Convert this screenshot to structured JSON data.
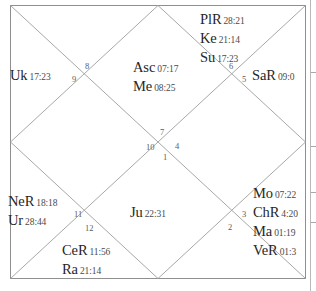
{
  "chart": {
    "type": "north-indian-vedic-kundli",
    "border_color": "#8a8a8a",
    "line_color": "#a0a0a0",
    "text_color": "#262626"
  },
  "houses": [
    {
      "number": "1",
      "x": 163,
      "y": 152
    },
    {
      "number": "2",
      "x": 228,
      "y": 222
    },
    {
      "number": "3",
      "x": 242,
      "y": 209
    },
    {
      "number": "4",
      "x": 175,
      "y": 141
    },
    {
      "number": "5",
      "x": 242,
      "y": 74
    },
    {
      "number": "6",
      "x": 229,
      "y": 61
    },
    {
      "number": "7",
      "x": 160,
      "y": 127
    },
    {
      "number": "8",
      "x": 85,
      "y": 61
    },
    {
      "number": "9",
      "x": 72,
      "y": 74
    },
    {
      "number": "10",
      "x": 146,
      "y": 142
    },
    {
      "number": "11",
      "x": 74,
      "y": 209
    },
    {
      "number": "12",
      "x": 85,
      "y": 223
    }
  ],
  "placements": [
    {
      "id": "block-house-6",
      "x": 200,
      "y": 10,
      "align": "left",
      "planets": [
        {
          "name": "PlR",
          "degree": "28:21"
        },
        {
          "name": "Ke",
          "degree": "21:14"
        },
        {
          "name": "Su",
          "degree": "17:23"
        }
      ]
    },
    {
      "id": "block-house-5",
      "x": 252,
      "y": 66,
      "align": "left",
      "planets": [
        {
          "name": "SaR",
          "degree": "09:0"
        }
      ]
    },
    {
      "id": "block-house-9",
      "x": 10,
      "y": 66,
      "align": "left",
      "planets": [
        {
          "name": "Uk",
          "degree": "17:23"
        }
      ]
    },
    {
      "id": "block-house-7-asc",
      "x": 133,
      "y": 58,
      "align": "left",
      "planets": [
        {
          "name": "Asc",
          "degree": "07:17"
        },
        {
          "name": "Me",
          "degree": "08:25"
        }
      ]
    },
    {
      "id": "block-house-11",
      "x": 8,
      "y": 192,
      "align": "left",
      "planets": [
        {
          "name": "NeR",
          "degree": "18:18"
        },
        {
          "name": "Ur",
          "degree": "28:44"
        }
      ]
    },
    {
      "id": "block-house-12",
      "x": 62,
      "y": 241,
      "align": "left",
      "planets": [
        {
          "name": "CeR",
          "degree": "11:56"
        },
        {
          "name": "Ra",
          "degree": "21:14"
        }
      ]
    },
    {
      "id": "block-house-1",
      "x": 130,
      "y": 203,
      "align": "left",
      "planets": [
        {
          "name": "Ju",
          "degree": "22:31"
        }
      ]
    },
    {
      "id": "block-house-3",
      "x": 253,
      "y": 184,
      "align": "left",
      "planets": [
        {
          "name": "Mo",
          "degree": "07:22"
        },
        {
          "name": "ChR",
          "degree": "4:20"
        },
        {
          "name": "Ma",
          "degree": "01:19"
        },
        {
          "name": "VeR",
          "degree": "01:3"
        }
      ]
    }
  ],
  "side_strip": {
    "name": "side-panel-edge",
    "ticks": [
      72,
      146,
      192,
      222
    ]
  }
}
